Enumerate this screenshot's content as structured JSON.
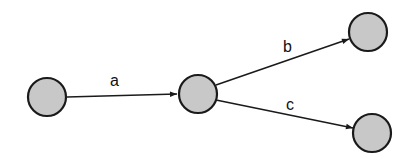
{
  "diagram": {
    "type": "directed-graph",
    "nodes": [
      {
        "id": "n1",
        "cx": 47,
        "cy": 97,
        "r": 19
      },
      {
        "id": "n2",
        "cx": 198,
        "cy": 94,
        "r": 19
      },
      {
        "id": "n3",
        "cx": 368,
        "cy": 32,
        "r": 19
      },
      {
        "id": "n4",
        "cx": 372,
        "cy": 133,
        "r": 19
      }
    ],
    "edges": [
      {
        "from": "n1",
        "to": "n2",
        "label": "a"
      },
      {
        "from": "n2",
        "to": "n3",
        "label": "b"
      },
      {
        "from": "n2",
        "to": "n4",
        "label": "c"
      }
    ],
    "colors": {
      "node_fill": "#c8c8c8",
      "stroke": "#1a1a1a"
    }
  }
}
